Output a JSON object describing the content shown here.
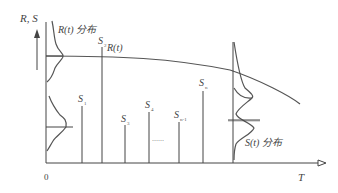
{
  "axes": {
    "y_label": "R, S",
    "x_label": "T",
    "origin_label": "0"
  },
  "curves": {
    "strength_curve_label": "R(t)",
    "strength_distribution_label": "R(t) 分布",
    "stress_distribution_label": "S(t) 分布"
  },
  "stress_samples": [
    {
      "label": "S",
      "sub": "1"
    },
    {
      "label": "S",
      "sub": "2"
    },
    {
      "label": "S",
      "sub": "3"
    },
    {
      "label": "S",
      "sub": "4"
    },
    {
      "label": "S",
      "sub": "n-1"
    },
    {
      "label": "S",
      "sub": "n"
    }
  ],
  "ellipsis": "……",
  "colors": {
    "line": "#444444",
    "text": "#444444",
    "background": "#ffffff"
  }
}
